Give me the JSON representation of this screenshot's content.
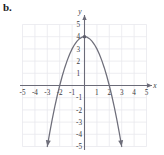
{
  "figure": {
    "label": "b.",
    "x_axis_name": "x",
    "y_axis_name": "y"
  },
  "chart_data": {
    "type": "line",
    "title": "",
    "xlabel": "x",
    "ylabel": "y",
    "xlim": [
      -5,
      5
    ],
    "ylim": [
      -5,
      5
    ],
    "grid": true,
    "legend": null,
    "equation": "y = -x^2 + 4",
    "vertex": [
      0,
      4
    ],
    "x_intercepts": [
      -2,
      2
    ],
    "y_intercept": 4,
    "opens": "down",
    "x_tick_labels": [
      "-5",
      "-4",
      "-3",
      "-2",
      "-1",
      "1",
      "2",
      "3",
      "4",
      "5"
    ],
    "x_ticks": [
      -5,
      -4,
      -3,
      -2,
      -1,
      1,
      2,
      3,
      4,
      5
    ],
    "y_tick_labels": [
      "5",
      "4",
      "3",
      "2",
      "1",
      "-1",
      "-2",
      "-3",
      "-4",
      "-5"
    ],
    "y_ticks": [
      5,
      4,
      3,
      2,
      1,
      -1,
      -2,
      -3,
      -4,
      -5
    ],
    "series": [
      {
        "name": "y = -x^2 + 4",
        "x": [
          -3.0,
          -2.8,
          -2.6,
          -2.4,
          -2.2,
          -2.0,
          -1.8,
          -1.6,
          -1.4,
          -1.2,
          -1.0,
          -0.8,
          -0.6,
          -0.4,
          -0.2,
          0.0,
          0.2,
          0.4,
          0.6,
          0.8,
          1.0,
          1.2,
          1.4,
          1.6,
          1.8,
          2.0,
          2.2,
          2.4,
          2.6,
          2.8,
          3.0
        ],
        "values": [
          -5.0,
          -3.84,
          -2.76,
          -1.76,
          -0.84,
          0.0,
          0.76,
          1.44,
          2.04,
          2.56,
          3.0,
          3.36,
          3.64,
          3.84,
          3.96,
          4.0,
          3.96,
          3.84,
          3.64,
          3.36,
          3.0,
          2.56,
          2.04,
          1.44,
          0.76,
          0.0,
          -0.84,
          -1.76,
          -2.76,
          -3.84,
          -5.0
        ]
      }
    ],
    "markers": [
      {
        "at": [
          0,
          4
        ],
        "shape": "dot"
      }
    ],
    "arrows": [
      "left-arm-down",
      "right-arm-down",
      "x-axis-right",
      "y-axis-up"
    ]
  },
  "colors": {
    "grid": "#e9e9ed",
    "axis": "#6b6b78",
    "curve": "#6e6e7a",
    "text": "#3a3a42",
    "label": "#1a1a1a",
    "background": "#ffffff"
  }
}
